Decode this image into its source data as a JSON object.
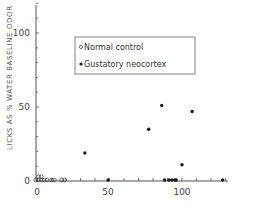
{
  "chart_data": {
    "type": "scatter",
    "title": "",
    "xlabel": "",
    "ylabel": "LICKS AS % WATER BASELINE ODOR",
    "xlim": [
      0,
      130
    ],
    "ylim": [
      0,
      120
    ],
    "x_ticks": [
      0,
      50,
      100
    ],
    "y_ticks": [
      0,
      50,
      100
    ],
    "grid": false,
    "legend_position": "upper center",
    "series": [
      {
        "name": "Normal control",
        "marker": "open-circle",
        "points": [
          [
            -1,
            0
          ],
          [
            1,
            3
          ],
          [
            3,
            3
          ],
          [
            1,
            0
          ],
          [
            3,
            0
          ],
          [
            5,
            0
          ],
          [
            7,
            0
          ],
          [
            10,
            0
          ],
          [
            12,
            0
          ],
          [
            17,
            0
          ],
          [
            19,
            0
          ]
        ]
      },
      {
        "name": "Gustatory neocortex",
        "marker": "filled-circle",
        "points": [
          [
            33,
            19
          ],
          [
            49,
            0
          ],
          [
            77,
            35
          ],
          [
            86,
            51
          ],
          [
            107,
            47
          ],
          [
            100,
            11
          ],
          [
            88,
            0
          ],
          [
            91,
            0
          ],
          [
            93,
            0
          ],
          [
            95,
            0
          ],
          [
            96,
            0
          ],
          [
            128,
            0
          ]
        ]
      }
    ]
  },
  "axes": {
    "y_label": "LICKS AS % WATER BASELINE ODOR",
    "y_tick_labels": [
      "0",
      "50",
      "100"
    ],
    "x_tick_labels": [
      "0",
      "50",
      "100"
    ]
  },
  "legend": {
    "items": [
      {
        "label": "Normal control",
        "marker": "open-circle"
      },
      {
        "label": "Gustatory neocortex",
        "marker": "filled-circle"
      }
    ]
  }
}
